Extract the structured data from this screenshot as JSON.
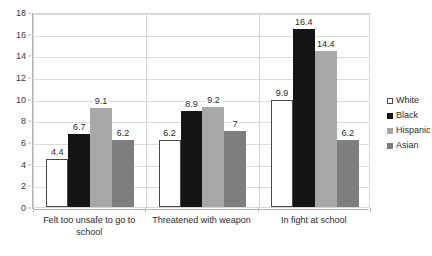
{
  "chart_data": {
    "type": "bar",
    "title": "",
    "subtitle": "",
    "xlabel": "",
    "ylabel": "",
    "ylim": [
      0,
      18
    ],
    "ytick_step": 2,
    "yticks": [
      "18",
      "16",
      "14",
      "12",
      "10",
      "8",
      "6",
      "4",
      "2",
      "0"
    ],
    "grid": true,
    "legend_position": "right",
    "categories": [
      "Felt too unsafe to go to school",
      "Threatened with weapon",
      "In fight at school"
    ],
    "series": [
      {
        "name": "White",
        "color": "#ffffff",
        "values": [
          4.4,
          6.2,
          9.9
        ]
      },
      {
        "name": "Black",
        "color": "#151515",
        "values": [
          6.7,
          8.9,
          16.4
        ]
      },
      {
        "name": "Hispanic",
        "color": "#a8a8a8",
        "values": [
          9.1,
          9.2,
          14.4
        ]
      },
      {
        "name": "Asian",
        "color": "#7e7e7e",
        "values": [
          6.2,
          7,
          6.2
        ]
      }
    ],
    "data_labels": [
      [
        "4.4",
        "6.7",
        "9.1",
        "6.2"
      ],
      [
        "6.2",
        "8.9",
        "9.2",
        "7"
      ],
      [
        "9.9",
        "16.4",
        "14.4",
        "6.2"
      ]
    ]
  }
}
